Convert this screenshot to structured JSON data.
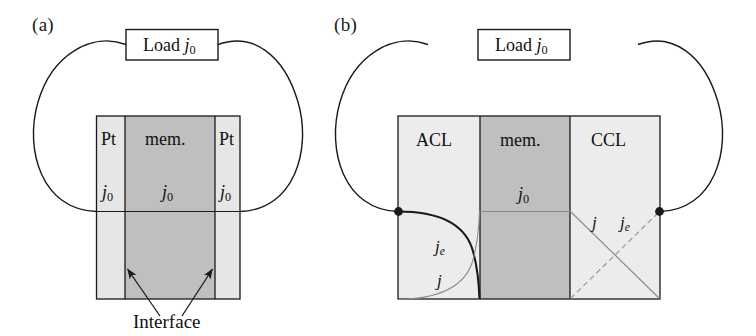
{
  "figure": {
    "width": 756,
    "height": 336,
    "background": "#ffffff",
    "type": "scientific-schematic"
  },
  "colors": {
    "line": "#1a1a1a",
    "text": "#111111",
    "electrode_light": "#e6e6e6",
    "membrane_dark": "#bfbfbf",
    "thin_curve": "#8c8c8c",
    "dashed_curve": "#9a9a9a"
  },
  "panel_a": {
    "label": "(a)",
    "load": {
      "text_main": "Load",
      "symbol": "j",
      "subscript": "0"
    },
    "layers": [
      {
        "name": "Pt",
        "current_main": "j",
        "current_sub": "0"
      },
      {
        "name": "mem.",
        "current_main": "j",
        "current_sub": "0"
      },
      {
        "name": "Pt",
        "current_main": "j",
        "current_sub": "0"
      }
    ],
    "annotation": {
      "label": "Interface",
      "arrow_count": 2
    }
  },
  "panel_b": {
    "label": "(b)",
    "load": {
      "text_main": "Load",
      "symbol": "j",
      "subscript": "0"
    },
    "layers": [
      {
        "name": "ACL"
      },
      {
        "name": "mem.",
        "current_main": "j",
        "current_sub": "0"
      },
      {
        "name": "CCL"
      }
    ],
    "curve_labels": {
      "acl_electron": {
        "symbol": "j",
        "subscript": "e"
      },
      "acl_proton": {
        "symbol": "j",
        "subscript": ""
      },
      "ccl_proton": {
        "symbol": "j",
        "subscript": ""
      },
      "ccl_electron": {
        "symbol": "j",
        "subscript": "e"
      }
    }
  }
}
